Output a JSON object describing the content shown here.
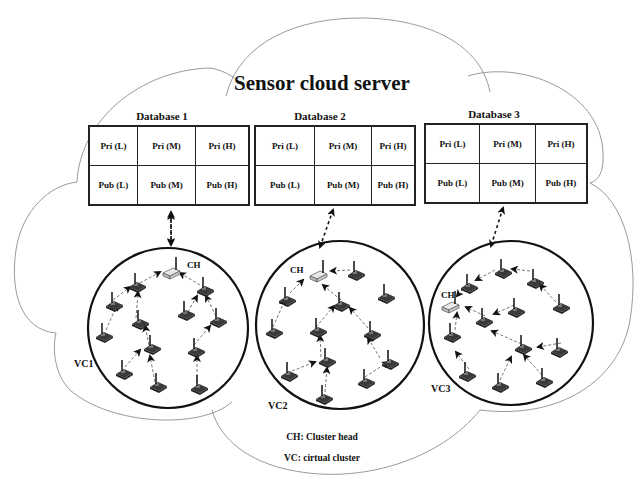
{
  "diagram": {
    "title": "Sensor cloud server",
    "databases": [
      {
        "label": "Database 1",
        "rows": [
          [
            "Pri (L)",
            "Pri (M)",
            "Pri (H)"
          ],
          [
            "Pub (L)",
            "Pub (M)",
            "Pub (H)"
          ]
        ]
      },
      {
        "label": "Database 2",
        "rows": [
          [
            "Pri (L)",
            "Pri (M)",
            "Pri (H)"
          ],
          [
            "Pub (L)",
            "Pub (M)",
            "Pub (H)"
          ]
        ]
      },
      {
        "label": "Database 3",
        "rows": [
          [
            "Pri (L)",
            "Pri (M)",
            "Pri (H)"
          ],
          [
            "Pub (L)",
            "Pub (M)",
            "Pub (H)"
          ]
        ]
      }
    ],
    "clusters": [
      {
        "label": "VC1",
        "head_label": "CH"
      },
      {
        "label": "VC2",
        "head_label": "CH"
      },
      {
        "label": "VC3",
        "head_label": "CH"
      }
    ],
    "legend": {
      "ch": "CH: Cluster head",
      "vc": "VC: cirtual cluster"
    }
  }
}
